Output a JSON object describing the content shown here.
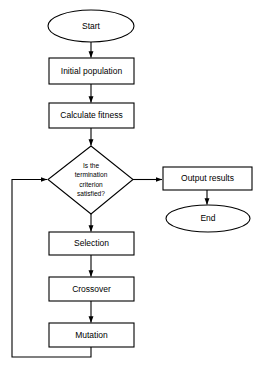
{
  "diagram": {
    "background_color": "#ffffff",
    "line_color": "#000000",
    "node_fill": "#ffffff",
    "nodes": {
      "start": {
        "label": "Start",
        "shape": "ellipse"
      },
      "initial_population": {
        "label": "Initial population",
        "shape": "rectangle"
      },
      "calculate_fitness": {
        "label": "Calculate fitness",
        "shape": "rectangle"
      },
      "decision": {
        "shape": "diamond",
        "lines": [
          "Is the",
          "termination",
          "criterion",
          "satisfied?"
        ]
      },
      "output_results": {
        "label": "Output results",
        "shape": "rectangle"
      },
      "end": {
        "label": "End",
        "shape": "ellipse"
      },
      "selection": {
        "label": "Selection",
        "shape": "rectangle"
      },
      "crossover": {
        "label": "Crossover",
        "shape": "rectangle"
      },
      "mutation": {
        "label": "Mutation",
        "shape": "rectangle"
      }
    },
    "edges": [
      {
        "name": "start-to-initial-population",
        "from": "start",
        "to": "initial_population",
        "label": ""
      },
      {
        "name": "initial-population-to-calculate-fitness",
        "from": "initial_population",
        "to": "calculate_fitness",
        "label": ""
      },
      {
        "name": "calculate-fitness-to-decision",
        "from": "calculate_fitness",
        "to": "decision",
        "label": ""
      },
      {
        "name": "decision-to-output-results",
        "from": "decision",
        "to": "output_results",
        "label": ""
      },
      {
        "name": "output-results-to-end",
        "from": "output_results",
        "to": "end",
        "label": ""
      },
      {
        "name": "decision-to-selection",
        "from": "decision",
        "to": "selection",
        "label": ""
      },
      {
        "name": "selection-to-crossover",
        "from": "selection",
        "to": "crossover",
        "label": ""
      },
      {
        "name": "crossover-to-mutation",
        "from": "crossover",
        "to": "mutation",
        "label": ""
      },
      {
        "name": "mutation-to-decision-feedback",
        "from": "mutation",
        "to": "decision",
        "label": ""
      }
    ]
  }
}
